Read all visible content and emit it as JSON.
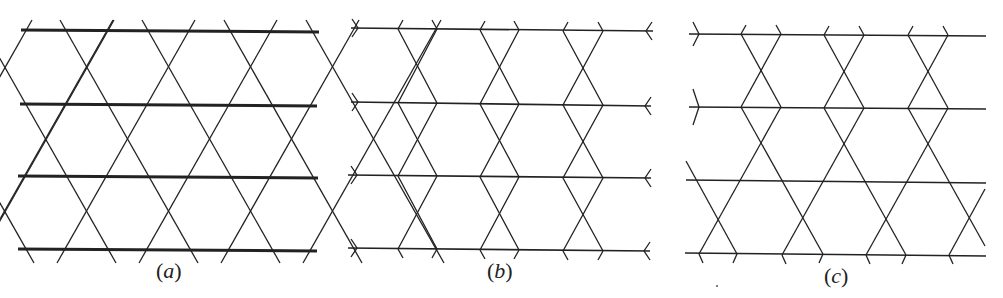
{
  "figure": {
    "stroke_color": "#222222",
    "panels": [
      {
        "id": "a",
        "label_open": "(",
        "label_letter": "a",
        "label_close": ")",
        "horizontal_line_ys": [
          31,
          105,
          177,
          250
        ],
        "horizontal_line_weight": "thick",
        "pattern": "kagome"
      },
      {
        "id": "b",
        "label_open": "(",
        "label_letter": "b",
        "label_close": ")",
        "horizontal_line_ys": [
          29,
          103,
          176,
          249
        ],
        "horizontal_line_weight": "thin",
        "pattern": "bow-tie columns"
      },
      {
        "id": "c",
        "label_open": "(",
        "label_letter": "c",
        "label_close": ")",
        "horizontal_line_ys": [
          34,
          107,
          181,
          254
        ],
        "horizontal_line_weight": "thin",
        "pattern": "bow-tie columns above, kagome below"
      }
    ]
  }
}
